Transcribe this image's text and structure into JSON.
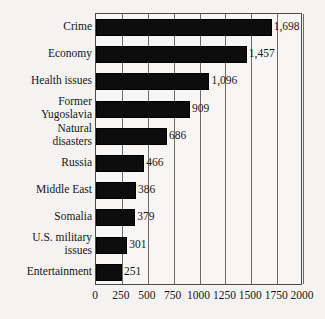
{
  "chart_data": {
    "type": "bar",
    "orientation": "horizontal",
    "title": "",
    "subtitle": "",
    "xlabel": "",
    "ylabel": "",
    "xlim": [
      0,
      2000
    ],
    "grid": true,
    "legend": false,
    "categories": [
      "Crime",
      "Economy",
      "Health issues",
      "Former\nYugoslavia",
      "Natural\ndisasters",
      "Russia",
      "Middle East",
      "Somalia",
      "U.S. military\nissues",
      "Entertainment"
    ],
    "values": [
      1698,
      1457,
      1096,
      909,
      686,
      466,
      386,
      379,
      301,
      251
    ],
    "value_labels": [
      "1,698",
      "1,457",
      "1,096",
      "909",
      "686",
      "466",
      "386",
      "379",
      "301",
      "251"
    ],
    "ticks": [
      0,
      250,
      500,
      750,
      1000,
      1250,
      1500,
      1750,
      2000
    ],
    "tick_labels": [
      "0",
      "250",
      "500",
      "750",
      "1000",
      "1250",
      "1500",
      "1750",
      "2000"
    ],
    "colors": {
      "bar": "#0d0d0d",
      "background": "#f4f3f1",
      "plot_background": "#f7f6f4",
      "frame": "#4a4a4a",
      "gridline": "#6b6b6b",
      "text": "#17161a"
    }
  }
}
